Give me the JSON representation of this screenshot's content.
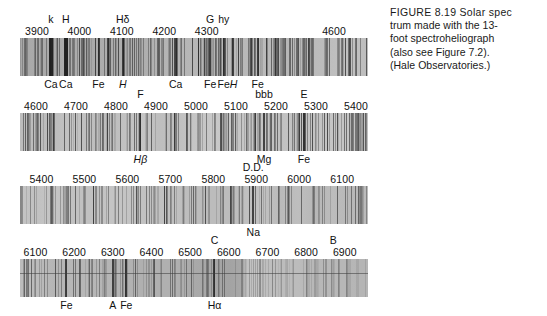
{
  "figure": {
    "caption_lines": [
      "FIGURE 8.19   Solar spec",
      "trum made with the 13-",
      "foot spectroheliograph",
      "(also see Figure 7.2).",
      "(Hale Observatories.)"
    ]
  },
  "chart_data": {
    "type": "heatmap",
    "title": "Solar spectrum made with the 13-foot spectroheliograph",
    "xlabel": "Wavelength (Angstroms)",
    "ylabel": "",
    "grid": false,
    "legend": "none",
    "strips": [
      {
        "name": "strip-1",
        "range": [
          3860,
          4680
        ],
        "ticks": [
          {
            "label": "3900",
            "wavelength": 3900
          },
          {
            "label": "4000",
            "wavelength": 4000
          },
          {
            "label": "4100",
            "wavelength": 4100
          },
          {
            "label": "4200",
            "wavelength": 4200
          },
          {
            "label": "4300",
            "wavelength": 4300
          },
          {
            "label": "4600",
            "wavelength": 4600
          }
        ],
        "upper_labels": [
          {
            "label": "k",
            "wavelength": 3933
          },
          {
            "label": "H",
            "wavelength": 3968
          },
          {
            "label": "Hδ",
            "wavelength": 4102
          },
          {
            "label": "G",
            "wavelength": 4308
          },
          {
            "label": "hy",
            "wavelength": 4340
          }
        ],
        "lower_labels": [
          {
            "label": "Ca",
            "wavelength": 3933,
            "italic": false
          },
          {
            "label": "Ca",
            "wavelength": 3968,
            "italic": false
          },
          {
            "label": "Fe",
            "wavelength": 4045,
            "italic": false
          },
          {
            "label": "H",
            "wavelength": 4102,
            "italic": true
          },
          {
            "label": "Ca",
            "wavelength": 4227,
            "italic": false
          },
          {
            "label": "Fe",
            "wavelength": 4308,
            "italic": false
          },
          {
            "label": "Fe",
            "wavelength": 4340,
            "italic": false
          },
          {
            "label": "H",
            "wavelength": 4363,
            "italic": true
          },
          {
            "label": "Fe",
            "wavelength": 4420,
            "italic": false
          }
        ]
      },
      {
        "name": "strip-2",
        "range": [
          4560,
          5430
        ],
        "ticks": [
          {
            "label": "4600",
            "wavelength": 4600
          },
          {
            "label": "4700",
            "wavelength": 4700
          },
          {
            "label": "4800",
            "wavelength": 4800
          },
          {
            "label": "4900",
            "wavelength": 4900
          },
          {
            "label": "5000",
            "wavelength": 5000
          },
          {
            "label": "5100",
            "wavelength": 5100
          },
          {
            "label": "5200",
            "wavelength": 5200
          },
          {
            "label": "5300",
            "wavelength": 5300
          },
          {
            "label": "5400",
            "wavelength": 5400
          }
        ],
        "upper_labels": [
          {
            "label": "F",
            "wavelength": 4861
          },
          {
            "label": "bbb",
            "wavelength": 5170
          },
          {
            "label": "E",
            "wavelength": 5270
          }
        ],
        "lower_labels": [
          {
            "label": "Hβ",
            "wavelength": 4861,
            "italic": true
          },
          {
            "label": "Mg",
            "wavelength": 5170,
            "italic": false
          },
          {
            "label": "Fe",
            "wavelength": 5270,
            "italic": false
          }
        ]
      },
      {
        "name": "strip-3",
        "range": [
          5350,
          6160
        ],
        "ticks": [
          {
            "label": "5400",
            "wavelength": 5400
          },
          {
            "label": "5500",
            "wavelength": 5500
          },
          {
            "label": "5600",
            "wavelength": 5600
          },
          {
            "label": "5700",
            "wavelength": 5700
          },
          {
            "label": "5800",
            "wavelength": 5800
          },
          {
            "label": "5900",
            "wavelength": 5900
          },
          {
            "label": "6000",
            "wavelength": 6000
          },
          {
            "label": "6100",
            "wavelength": 6100
          }
        ],
        "upper_labels": [
          {
            "label": "D.D.",
            "wavelength": 5893
          }
        ],
        "lower_labels": [
          {
            "label": "Na",
            "wavelength": 5893,
            "italic": false
          }
        ]
      },
      {
        "name": "strip-4",
        "range": [
          6060,
          6960
        ],
        "ticks": [
          {
            "label": "6100",
            "wavelength": 6100
          },
          {
            "label": "6200",
            "wavelength": 6200
          },
          {
            "label": "6300",
            "wavelength": 6300
          },
          {
            "label": "6400",
            "wavelength": 6400
          },
          {
            "label": "6500",
            "wavelength": 6500
          },
          {
            "label": "6600",
            "wavelength": 6600
          },
          {
            "label": "6700",
            "wavelength": 6700
          },
          {
            "label": "6800",
            "wavelength": 6800
          },
          {
            "label": "6900",
            "wavelength": 6900
          }
        ],
        "upper_labels": [
          {
            "label": "C",
            "wavelength": 6563
          },
          {
            "label": "B",
            "wavelength": 6870
          }
        ],
        "lower_labels": [
          {
            "label": "Fe",
            "wavelength": 6180,
            "italic": false
          },
          {
            "label": "A",
            "wavelength": 6300,
            "italic": false
          },
          {
            "label": "Fe",
            "wavelength": 6335,
            "italic": false
          },
          {
            "label": "Hα",
            "wavelength": 6563,
            "italic": false
          }
        ]
      }
    ]
  }
}
